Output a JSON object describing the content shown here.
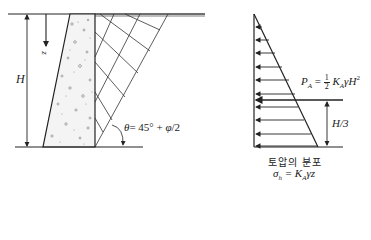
{
  "diagram": {
    "left_panel": {
      "name": "retaining-wall-with-failure-wedge",
      "height_label": "H",
      "depth_label": "z",
      "angle_label": {
        "symbol": "θ",
        "equals": "= 45° + ",
        "phi": "φ",
        "suffix": "/2"
      },
      "colors": {
        "line": "#222222",
        "ground_shade": "#bdbdbd",
        "wall_fill": "#f4f4f4"
      }
    },
    "right_panel": {
      "name": "active-earth-pressure-distribution",
      "force_label": {
        "P": "P",
        "sub": "A",
        "equals": " = ",
        "frac_num": "1",
        "frac_den": "2",
        "K": " K",
        "K_sub": "A",
        "gamma": "γH",
        "sup": "2"
      },
      "offset_label": "H/3",
      "caption_korean": "토압의 분포",
      "stress_formula": {
        "sigma": "σ",
        "sub": "h",
        "equals": " = K",
        "K_sub": "A",
        "rest": "γz"
      }
    }
  }
}
